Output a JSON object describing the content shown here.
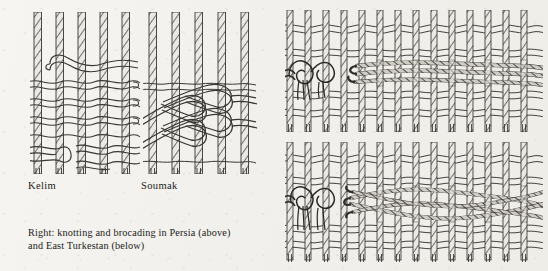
{
  "page": {
    "background_color": "#f3f2ee",
    "ink_color": "#3a3734",
    "width": 548,
    "height": 271,
    "kind": "book-plate-illustration"
  },
  "figures": [
    {
      "id": "kelim",
      "label": "Kelim",
      "label_x": 28,
      "label_y": 182,
      "diagram": "weave-kelim",
      "warp_count": 5,
      "weft_rows": 9,
      "x": 30,
      "y": 12,
      "w": 110,
      "h": 162
    },
    {
      "id": "soumak",
      "label": "Soumak",
      "label_x": 141,
      "label_y": 182,
      "diagram": "weave-soumak",
      "warp_count": 5,
      "weft_rows": 4,
      "x": 143,
      "y": 12,
      "w": 112,
      "h": 162
    },
    {
      "id": "persia-knotting",
      "label": "",
      "diagram": "weave-knotting-persia",
      "warp_count": 14,
      "weft_rows": 6,
      "x": 285,
      "y": 10,
      "w": 255,
      "h": 120
    },
    {
      "id": "east-turkestan-knotting",
      "label": "",
      "diagram": "weave-knotting-east-turkestan",
      "warp_count": 14,
      "weft_rows": 6,
      "x": 285,
      "y": 142,
      "w": 255,
      "h": 118
    }
  ],
  "caption": {
    "lines": [
      "Right: knotting and brocading in Persia (above)",
      "and East Turkestan (below)"
    ]
  },
  "colors": {
    "paper": "#f3f2ee",
    "ink": "#3a3734",
    "ink_light": "#6f6b66",
    "yarn_fill": "#d9d6d0",
    "knot_dark": "#2a2724"
  }
}
